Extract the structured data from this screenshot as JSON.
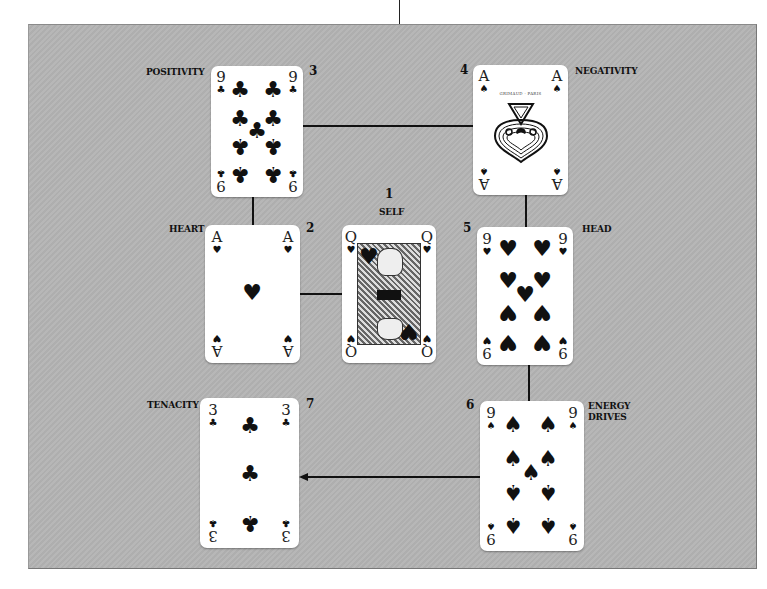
{
  "layout": {
    "title": "Card spread layout",
    "panel_color": "#b4b4b4"
  },
  "positions": [
    {
      "number": "1",
      "label": "SELF",
      "card": {
        "rank": "Q",
        "suit": "hearts",
        "suit_glyph": "♥",
        "corner_suit_bottom": "♠",
        "description": "Queen of Hearts"
      }
    },
    {
      "number": "2",
      "label": "HEART",
      "card": {
        "rank": "A",
        "suit": "hearts",
        "suit_glyph": "♥",
        "corner_suit_bottom": "♠",
        "description": "Ace of Hearts"
      }
    },
    {
      "number": "3",
      "label": "POSITIVITY",
      "card": {
        "rank": "9",
        "suit": "clubs",
        "suit_glyph": "♣",
        "description": "Nine of Clubs"
      }
    },
    {
      "number": "4",
      "label": "NEGATIVITY",
      "card": {
        "rank": "A",
        "suit": "spades",
        "suit_glyph": "♠",
        "maker_text": "GRIMAUD · PARIS",
        "description": "Ace of Spades"
      }
    },
    {
      "number": "5",
      "label": "HEAD",
      "card": {
        "rank": "9",
        "suit": "hearts",
        "suit_glyph": "♥",
        "description": "Nine of Hearts"
      }
    },
    {
      "number": "6",
      "label": "ENERGY DRIVES",
      "label_lines": [
        "ENERGY",
        "DRIVES"
      ],
      "card": {
        "rank": "9",
        "suit": "spades",
        "suit_glyph": "♠",
        "description": "Nine of Spades"
      }
    },
    {
      "number": "7",
      "label": "TENACITY",
      "card": {
        "rank": "3",
        "suit": "clubs",
        "suit_glyph": "♣",
        "description": "Three of Clubs"
      }
    }
  ],
  "connectors": [
    {
      "from": "3",
      "to": "4",
      "type": "line"
    },
    {
      "from": "3",
      "to": "2",
      "type": "line"
    },
    {
      "from": "2",
      "to": "1",
      "type": "line"
    },
    {
      "from": "4",
      "to": "5",
      "type": "line"
    },
    {
      "from": "5",
      "to": "6",
      "type": "line"
    },
    {
      "from": "6",
      "to": "7",
      "type": "arrow"
    }
  ]
}
